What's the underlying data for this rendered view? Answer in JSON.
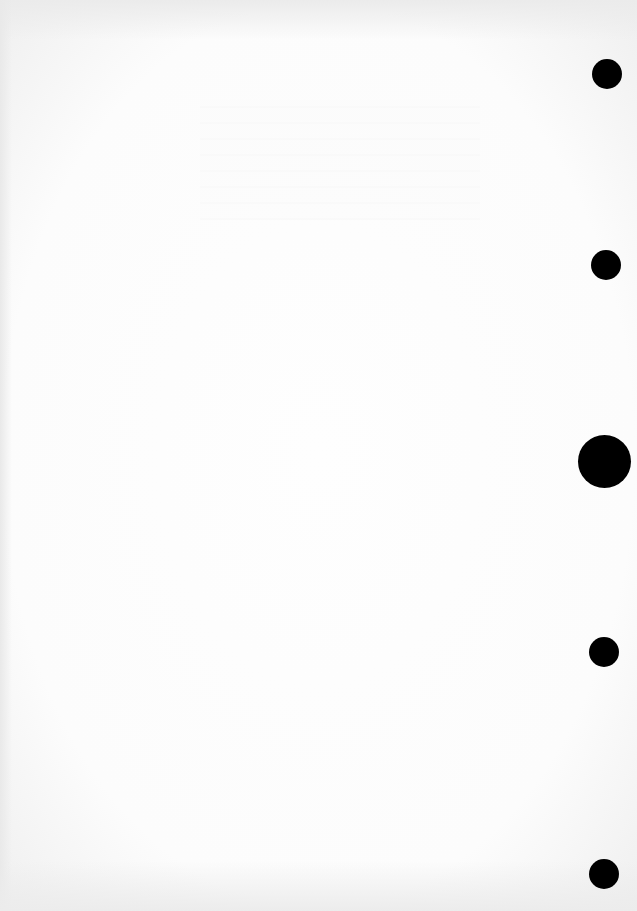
{
  "document": {
    "type": "blank scanned page",
    "text": "",
    "punch_holes": [
      {
        "x": 607,
        "y": 74,
        "d": 30
      },
      {
        "x": 606,
        "y": 265,
        "d": 30
      },
      {
        "x": 604,
        "y": 461,
        "d": 53
      },
      {
        "x": 604,
        "y": 652,
        "d": 30
      },
      {
        "x": 604,
        "y": 874,
        "d": 30
      }
    ]
  }
}
